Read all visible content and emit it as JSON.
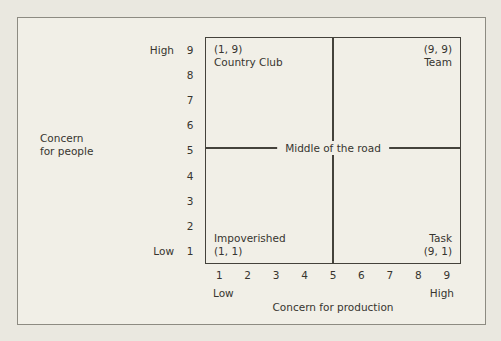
{
  "figure": {
    "title_semantic": "Blake-Mouton managerial grid",
    "background_color": "#f1efe7",
    "outer_border_color": "#8d8b82",
    "grid_line_color": "#44423b",
    "text_color": "#37352f"
  },
  "y_axis": {
    "label_line1": "Concern",
    "label_line2": "for people",
    "high_label": "High",
    "low_label": "Low",
    "ticks": [
      "9",
      "8",
      "7",
      "6",
      "5",
      "4",
      "3",
      "2",
      "1"
    ]
  },
  "x_axis": {
    "title": "Concern for production",
    "low_label": "Low",
    "high_label": "High",
    "ticks": [
      "1",
      "2",
      "3",
      "4",
      "5",
      "6",
      "7",
      "8",
      "9"
    ]
  },
  "quadrants": {
    "top_left": {
      "coord": "(1, 9)",
      "name": "Country Club"
    },
    "top_right": {
      "coord": "(9, 9)",
      "name": "Team"
    },
    "bottom_left": {
      "name": "Impoverished",
      "coord": "(1, 1)"
    },
    "bottom_right": {
      "name": "Task",
      "coord": "(9, 1)"
    },
    "center": {
      "name": "Middle of the road",
      "coord": "(5, 5)"
    }
  }
}
